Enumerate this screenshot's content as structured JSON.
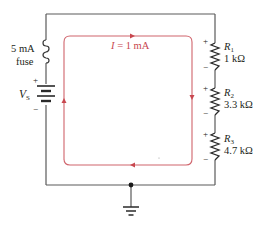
{
  "colors": {
    "wire": "#5a5a5a",
    "current_loop": "#d0646c",
    "text": "#231f20",
    "current_text": "#c8474f"
  },
  "fuse": {
    "rating": "5 mA",
    "label": "fuse"
  },
  "source": {
    "symbol": "V",
    "subscript": "S",
    "plus": "+",
    "minus": "−"
  },
  "current": {
    "symbol": "I",
    "value": " = 1 mA"
  },
  "resistors": [
    {
      "symbol": "R",
      "subscript": "1",
      "value": "1 kΩ",
      "plus": "+",
      "minus": "−"
    },
    {
      "symbol": "R",
      "subscript": "2",
      "value": "3.3 kΩ",
      "plus": "+",
      "minus": "−"
    },
    {
      "symbol": "R",
      "subscript": "3",
      "value": "4.7 kΩ",
      "plus": "+",
      "minus": "−"
    }
  ],
  "ground": {
    "icon": "ground-icon"
  }
}
